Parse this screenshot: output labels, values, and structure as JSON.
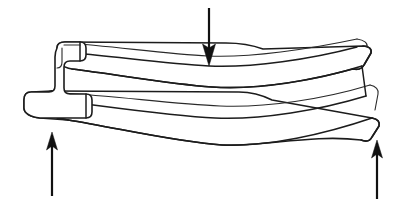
{
  "figure": {
    "title": "Three-point bending of an I-section beam",
    "background_color": "#ffffff",
    "line_color": "#1c1c1c",
    "arrow_color": "#111111",
    "width": 418,
    "height": 202
  },
  "specimen": {
    "name": "I-beam specimen",
    "cross_section": "I-section (rail profile)",
    "view": "perspective side view",
    "deflection": "sagging (concave up) under central load",
    "label": ""
  },
  "arrows": [
    {
      "id": "applied-load",
      "role": "applied load",
      "direction": "down",
      "label": "",
      "tip_x": 209,
      "tip_y": 66,
      "tail_x": 209,
      "tail_y": 8,
      "shaft_width": 2.2,
      "head_width": 13,
      "head_length": 22
    },
    {
      "id": "support-reaction-left",
      "role": "support reaction",
      "direction": "up",
      "label": "",
      "tip_x": 52,
      "tip_y": 132,
      "tail_x": 52,
      "tail_y": 196,
      "shaft_width": 2.2,
      "head_width": 11,
      "head_length": 18
    },
    {
      "id": "support-reaction-right",
      "role": "support reaction",
      "direction": "up",
      "label": "",
      "tip_x": 377,
      "tip_y": 140,
      "tail_x": 377,
      "tail_y": 199,
      "shaft_width": 2.2,
      "head_width": 11,
      "head_length": 18
    }
  ],
  "geometry": {
    "top_flange_top_edge": "M 75,53 C 120,57 168,64 209,66 C 252,68 312,59 357,47",
    "top_flange_bottom_edge": "M 72,69 C 120,75 170,84 212,87 C 258,90 318,80 362,66",
    "bottom_flange_top_edge": "M 70,102 C 118,108 172,116 215,118 C 262,120 320,110 366,96",
    "bottom_flange_bottom_edge": "M 68,120 C 118,128 176,142 222,145 C 268,147 325,134 372,118",
    "left_end_profile": "I-section end face with upper head, narrow web, wide foot",
    "right_end_profile": "angled end face showing flange thickness"
  }
}
